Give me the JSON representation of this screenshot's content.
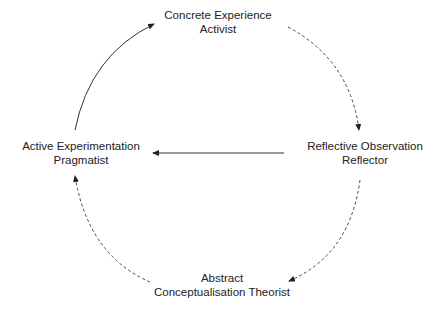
{
  "diagram": {
    "type": "cycle",
    "nodes": [
      {
        "id": "top",
        "line1": "Concrete Experience",
        "line2": "Activist"
      },
      {
        "id": "right",
        "line1": "Reflective Observation",
        "line2": "Reflector"
      },
      {
        "id": "bottom",
        "line1": "Abstract",
        "line2": "Conceptualisation Theorist"
      },
      {
        "id": "left",
        "line1": "Active Experimentation",
        "line2": "Pragmatist"
      }
    ],
    "edges": [
      {
        "from": "top",
        "to": "right",
        "style": "dashed",
        "shape": "arc"
      },
      {
        "from": "right",
        "to": "bottom",
        "style": "dashed",
        "shape": "arc"
      },
      {
        "from": "bottom",
        "to": "left",
        "style": "dashed",
        "shape": "arc"
      },
      {
        "from": "left",
        "to": "top",
        "style": "solid",
        "shape": "arc"
      },
      {
        "from": "right",
        "to": "left",
        "style": "solid",
        "shape": "straight"
      }
    ],
    "colors": {
      "line": "#333333",
      "text": "#222222",
      "background": "#ffffff"
    }
  }
}
